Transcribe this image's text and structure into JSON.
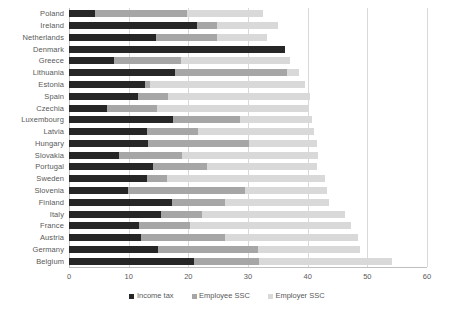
{
  "chart_data": {
    "type": "bar",
    "orientation": "horizontal",
    "stacked": true,
    "title": "",
    "xlabel": "",
    "ylabel": "",
    "xlim": [
      0,
      60
    ],
    "xticks": [
      0,
      10,
      20,
      30,
      40,
      50,
      60
    ],
    "grid": true,
    "legend_position": "bottom",
    "colors": {
      "income_tax": "#262626",
      "employee_ssc": "#a6a6a6",
      "employer_ssc": "#d9d9d9",
      "gridline": "#d9d9d9",
      "text": "#595959"
    },
    "categories": [
      "Poland",
      "Ireland",
      "Netherlands",
      "Denmark",
      "Greece",
      "Lithuania",
      "Estonia",
      "Spain",
      "Czechia",
      "Luxembourg",
      "Latvia",
      "Hungary",
      "Slovakia",
      "Portugal",
      "Sweden",
      "Slovenia",
      "Finland",
      "Italy",
      "France",
      "Austria",
      "Germany",
      "Belgium"
    ],
    "series": [
      {
        "name": "Income tax",
        "color": "#262626",
        "values": [
          4.4,
          21.4,
          14.5,
          36.2,
          7.5,
          17.8,
          12.7,
          11.6,
          6.4,
          17.5,
          13.1,
          13.2,
          8.3,
          14.0,
          13.1,
          9.9,
          17.3,
          15.5,
          11.7,
          12.1,
          14.9,
          21.0
        ]
      },
      {
        "name": "Employee SSC",
        "color": "#a6a6a6",
        "values": [
          15.4,
          3.4,
          10.3,
          0.0,
          11.2,
          18.7,
          0.9,
          5.0,
          8.3,
          11.2,
          8.6,
          16.9,
          10.6,
          9.1,
          3.3,
          19.6,
          8.9,
          6.8,
          8.6,
          14.0,
          16.8,
          10.9
        ]
      },
      {
        "name": "Employer SSC",
        "color": "#d9d9d9",
        "values": [
          12.7,
          10.3,
          8.4,
          0.0,
          18.3,
          2.0,
          26.0,
          23.8,
          25.5,
          12.0,
          19.3,
          11.4,
          22.9,
          18.4,
          26.5,
          13.7,
          17.3,
          24.0,
          27.0,
          22.3,
          17.1,
          22.2
        ]
      }
    ],
    "totals": [
      32.5,
      35.1,
      33.2,
      36.2,
      37.0,
      38.5,
      39.6,
      40.4,
      40.2,
      40.7,
      41.0,
      41.5,
      41.8,
      41.5,
      42.9,
      43.2,
      43.5,
      46.3,
      47.3,
      48.4,
      48.8,
      54.1
    ]
  },
  "legend": {
    "items": [
      {
        "label": "Income tax",
        "swatch": "income-tax-swatch"
      },
      {
        "label": "Employee SSC",
        "swatch": "employee-ssc-swatch"
      },
      {
        "label": "Employer SSC",
        "swatch": "employer-ssc-swatch"
      }
    ]
  }
}
